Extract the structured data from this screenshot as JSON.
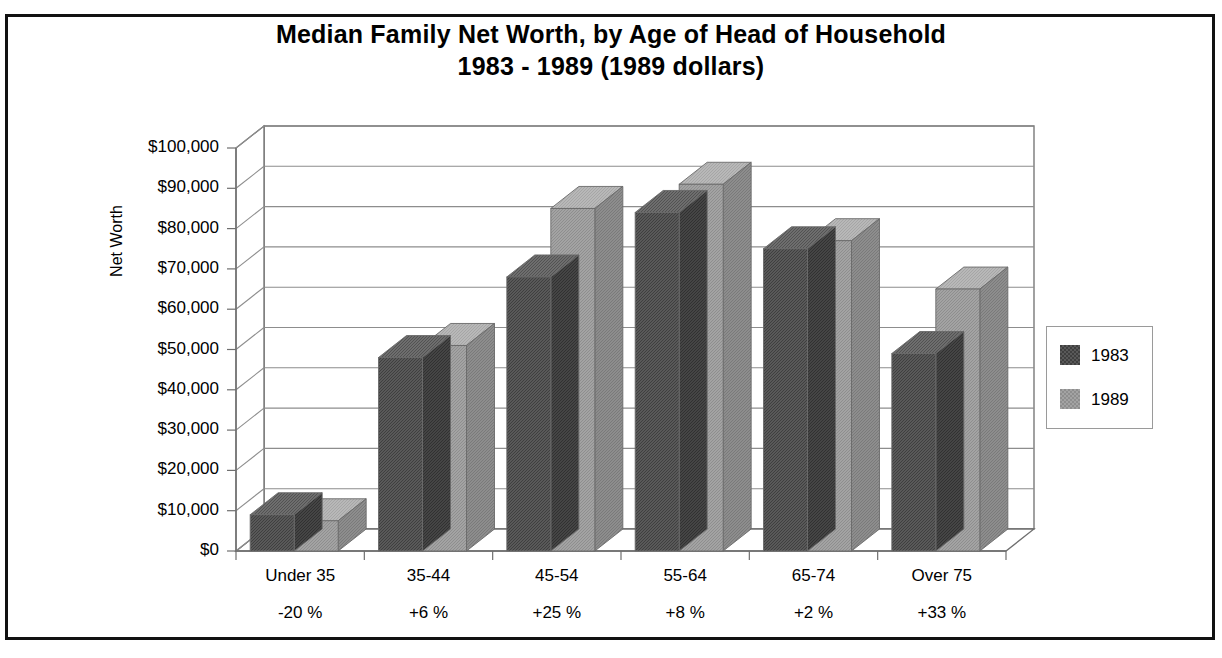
{
  "chart_data": {
    "type": "bar",
    "title": "Median Family Net Worth, by Age of Head of Household",
    "subtitle": "1983 - 1989  (1989 dollars)",
    "xlabel": "",
    "ylabel": "Net Worth",
    "ylim": [
      0,
      100000
    ],
    "ytick_step": 10000,
    "grid": true,
    "legend_position": "right",
    "style": "3d-clustered-column",
    "categories": [
      "Under 35",
      "35-44",
      "45-54",
      "55-64",
      "65-74",
      "Over 75"
    ],
    "category_change": [
      "-20 %",
      "+6 %",
      "+25 %",
      "+8 %",
      "+2 %",
      "+33 %"
    ],
    "series": [
      {
        "name": "1983",
        "color": "#595959",
        "values": [
          9000,
          48000,
          68000,
          84000,
          75000,
          49000
        ]
      },
      {
        "name": "1989",
        "color": "#a3a3a3",
        "values": [
          7500,
          51000,
          85000,
          91000,
          77000,
          65000
        ]
      }
    ],
    "ytick_labels": [
      "$100,000",
      "$90,000",
      "$80,000",
      "$70,000",
      "$60,000",
      "$50,000",
      "$40,000",
      "$30,000",
      "$20,000",
      "$10,000",
      "$0"
    ],
    "ytick_values": [
      100000,
      90000,
      80000,
      70000,
      60000,
      50000,
      40000,
      30000,
      20000,
      10000,
      0
    ]
  },
  "legend": {
    "items": [
      {
        "label": "1983",
        "color": "#595959"
      },
      {
        "label": "1989",
        "color": "#a3a3a3"
      }
    ]
  },
  "colors": {
    "series_1983": "#595959",
    "series_1983_side": "#454545",
    "series_1983_top": "#6e6e6e",
    "series_1989": "#a3a3a3",
    "series_1989_side": "#8d8d8d",
    "series_1989_top": "#b8b8b8",
    "frame": "#111111",
    "gridline": "#8d8d8d",
    "axis": "#6f6f6f"
  }
}
